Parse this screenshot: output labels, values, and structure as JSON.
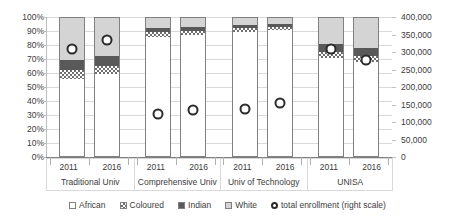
{
  "chart_data": {
    "type": "bar",
    "subtype": "stacked-percent-bar-with-line-markers",
    "title": "",
    "xlabel": "",
    "ylabel": "",
    "y2label": "",
    "grid": true,
    "legend_position": "bottom",
    "categories": [
      "2011",
      "2016",
      "2011",
      "2016",
      "2011",
      "2016",
      "2011",
      "2016"
    ],
    "groups": [
      {
        "label": "Traditional Univ",
        "years": [
          "2011",
          "2016"
        ]
      },
      {
        "label": "Comprehensive Univ",
        "years": [
          "2011",
          "2016"
        ]
      },
      {
        "label": "Univ of Technology",
        "years": [
          "2011",
          "2016"
        ]
      },
      {
        "label": "UNISA",
        "years": [
          "2011",
          "2016"
        ]
      }
    ],
    "yaxis": {
      "side": "left",
      "ticks": [
        "0%",
        "10%",
        "20%",
        "30%",
        "40%",
        "50%",
        "60%",
        "70%",
        "80%",
        "90%",
        "100%"
      ],
      "values": [
        0,
        10,
        20,
        30,
        40,
        50,
        60,
        70,
        80,
        90,
        100
      ],
      "ylim": [
        0,
        100
      ]
    },
    "y2axis": {
      "side": "right",
      "ticks": [
        "0",
        "50,000",
        "100,000",
        "150,000",
        "200,000",
        "250,000",
        "300,000",
        "350,000",
        "400,000"
      ],
      "values": [
        0,
        50000,
        100000,
        150000,
        200000,
        250000,
        300000,
        350000,
        400000
      ],
      "ylim": [
        0,
        400000
      ]
    },
    "series": [
      {
        "name": "African",
        "values": [
          56,
          59,
          86,
          87,
          89,
          91,
          71,
          68
        ]
      },
      {
        "name": "Coloured",
        "values": [
          6,
          6,
          3,
          3,
          3,
          2,
          4,
          4
        ]
      },
      {
        "name": "Indian",
        "values": [
          7,
          7,
          3,
          3,
          2,
          2,
          6,
          6
        ]
      },
      {
        "name": "White",
        "values": [
          31,
          28,
          8,
          7,
          6,
          5,
          19,
          22
        ]
      }
    ],
    "marker_series": {
      "name": "total enrollment (right scale)",
      "axis": "right",
      "percent_positions": [
        80,
        86,
        33,
        36,
        37,
        41,
        80,
        72
      ],
      "values": [
        320000,
        344000,
        132000,
        144000,
        148000,
        164000,
        320000,
        288000
      ]
    }
  },
  "legend": {
    "items": [
      {
        "label": "African",
        "icon": "square-outline-swatch"
      },
      {
        "label": "Coloured",
        "icon": "checkered-square-swatch"
      },
      {
        "label": "Indian",
        "icon": "dark-square-swatch"
      },
      {
        "label": "White",
        "icon": "light-square-swatch"
      },
      {
        "label": "total enrollment (right scale)",
        "icon": "circle-marker-icon"
      }
    ]
  },
  "colors": {
    "african": "#ffffff",
    "coloured": "#6e6e6e",
    "indian": "#595959",
    "white": "#d4d4d4",
    "marker": "#2b2b2b",
    "grid": "#d9d9d9",
    "axis": "#7f7f7f",
    "text": "#3c3c3c"
  }
}
